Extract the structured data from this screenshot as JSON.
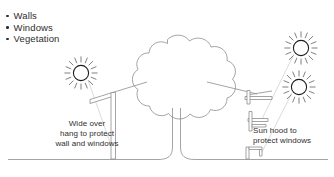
{
  "diagram": {
    "legend": {
      "items": [
        {
          "label": "Walls"
        },
        {
          "label": "Windows"
        },
        {
          "label": "Vegetation"
        }
      ]
    },
    "annotations": {
      "left": "Wide over\nhang to protect\nwall and windows",
      "right": "Sun hood to\nprotect windows"
    },
    "elements": {
      "tree_label": "tree-canopy",
      "trunk_label": "tree-trunk",
      "ground_label": "ground-line",
      "left_building_label": "wide-overhang-wall",
      "right_building_label": "sun-hood-wall",
      "suns": [
        {
          "name": "sun-left",
          "cx": 81,
          "cy": 73,
          "r": 7.6
        },
        {
          "name": "sun-right-upper",
          "cx": 301,
          "cy": 48,
          "r": 7.6
        },
        {
          "name": "sun-right-lower",
          "cx": 299,
          "cy": 87,
          "r": 7.6
        }
      ],
      "sun_ray_count": 16
    },
    "colors": {
      "stroke": "#8d8d8d",
      "stroke_dark": "#1d1d1d",
      "text": "#2e2e2e",
      "background": "#ffffff",
      "ground": "#9a9a9a"
    }
  }
}
